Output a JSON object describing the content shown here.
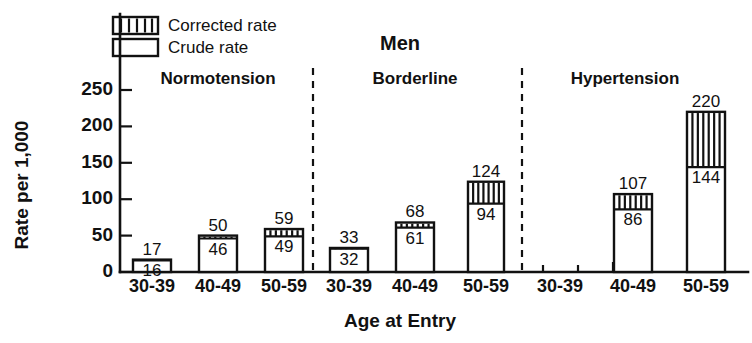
{
  "chart_data": {
    "type": "bar",
    "title": "Men",
    "xlabel": "Age at Entry",
    "ylabel": "Rate per 1,000",
    "ylim": [
      0,
      275
    ],
    "yticks": [
      0,
      50,
      100,
      150,
      200,
      250
    ],
    "ytick_labels": [
      "0",
      "50",
      "100",
      "150",
      "200",
      "250"
    ],
    "grid": false,
    "legend_position": "top-left",
    "legend": [
      {
        "key": "corrected",
        "label": "Corrected rate",
        "pattern": "vertical-hatch"
      },
      {
        "key": "crude",
        "label": "Crude rate",
        "pattern": "open"
      }
    ],
    "groups": [
      {
        "name": "Normotension",
        "categories": [
          "30-39",
          "40-49",
          "50-59"
        ],
        "corrected": [
          17,
          50,
          59
        ],
        "crude": [
          16,
          46,
          49
        ]
      },
      {
        "name": "Borderline",
        "categories": [
          "30-39",
          "40-49",
          "50-59"
        ],
        "corrected": [
          33,
          68,
          124
        ],
        "crude": [
          32,
          61,
          94
        ]
      },
      {
        "name": "Hypertension",
        "categories": [
          "30-39",
          "40-49",
          "50-59"
        ],
        "corrected": [
          null,
          107,
          220
        ],
        "crude": [
          null,
          86,
          144
        ]
      }
    ],
    "series": [
      {
        "name": "Corrected rate",
        "values": [
          17,
          50,
          59,
          33,
          68,
          124,
          null,
          107,
          220
        ]
      },
      {
        "name": "Crude rate",
        "values": [
          16,
          46,
          49,
          32,
          61,
          94,
          null,
          86,
          144
        ]
      }
    ],
    "categories": [
      "30-39",
      "40-49",
      "50-59",
      "30-39",
      "40-49",
      "50-59",
      "30-39",
      "40-49",
      "50-59"
    ]
  },
  "axis": {
    "y_title": "Rate per 1,000",
    "x_title": "Age at Entry"
  },
  "colors": {
    "ink": "#111111",
    "background": "#ffffff"
  }
}
